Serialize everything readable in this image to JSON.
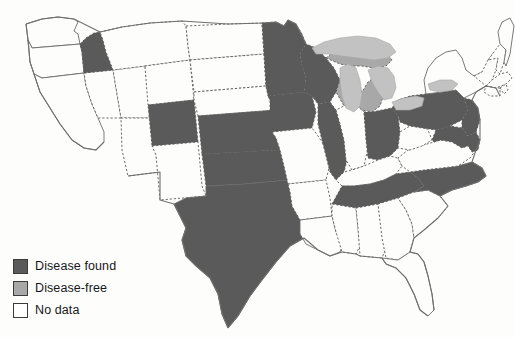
{
  "map": {
    "title": "United States disease status choropleth map",
    "colors": {
      "disease_found": "#5a5a5a",
      "disease_free": "#a8a8a8",
      "no_data": "#fdfdfc",
      "lake": "#c2c2c2",
      "border": "#5a5a5a",
      "coastline": "#6f6f6f"
    },
    "categories": {
      "disease_found": [
        "Idaho",
        "Colorado",
        "Kansas",
        "Oklahoma",
        "Texas",
        "Minnesota",
        "Wisconsin",
        "Iowa",
        "Illinois",
        "Ohio",
        "Pennsylvania",
        "New Jersey",
        "Delaware",
        "Maryland",
        "Tennessee",
        "North Carolina"
      ],
      "disease_free": [
        "Michigan"
      ],
      "no_data": [
        "Washington",
        "Oregon",
        "California",
        "Nevada",
        "Arizona",
        "Utah",
        "Montana",
        "Wyoming",
        "New Mexico",
        "North Dakota",
        "South Dakota",
        "Nebraska",
        "Missouri",
        "Arkansas",
        "Louisiana",
        "Mississippi",
        "Alabama",
        "Georgia",
        "Florida",
        "South Carolina",
        "Virginia",
        "West Virginia",
        "Kentucky",
        "Indiana",
        "New York",
        "Vermont",
        "New Hampshire",
        "Maine",
        "Massachusetts",
        "Rhode Island",
        "Connecticut"
      ]
    }
  },
  "legend": {
    "items": [
      {
        "id": "disease-found",
        "label": "Disease found",
        "color": "#5a5a5a"
      },
      {
        "id": "disease-free",
        "label": "Disease-free",
        "color": "#a8a8a8"
      },
      {
        "id": "no-data",
        "label": "No data",
        "color": "#ffffff"
      }
    ]
  }
}
